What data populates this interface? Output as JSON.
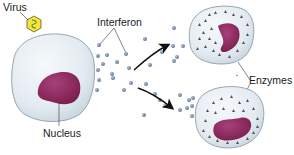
{
  "labels": {
    "virus": "Virus",
    "interferon": "Interferon",
    "nucleus": "Nucleus",
    "enzymes": "Enzymes"
  },
  "colors": {
    "cell_fill": "#e4ecf2",
    "cell_stroke": "#8a98a6",
    "nucleus": "#8e2a5c",
    "virus_fill": "#f2e63a",
    "virus_stroke": "#6a6a2a",
    "interferon": "#6f8aa8",
    "enzyme": "#5a4e58",
    "arrow": "#111111",
    "leader": "#222222"
  },
  "components": [
    {
      "id": "infected-cell",
      "role": "cell infected by virus, releases interferon"
    },
    {
      "id": "neighbor-cell-top",
      "role": "neighboring cell producing antiviral enzymes"
    },
    {
      "id": "neighbor-cell-bottom",
      "role": "neighboring cell producing antiviral enzymes"
    }
  ]
}
